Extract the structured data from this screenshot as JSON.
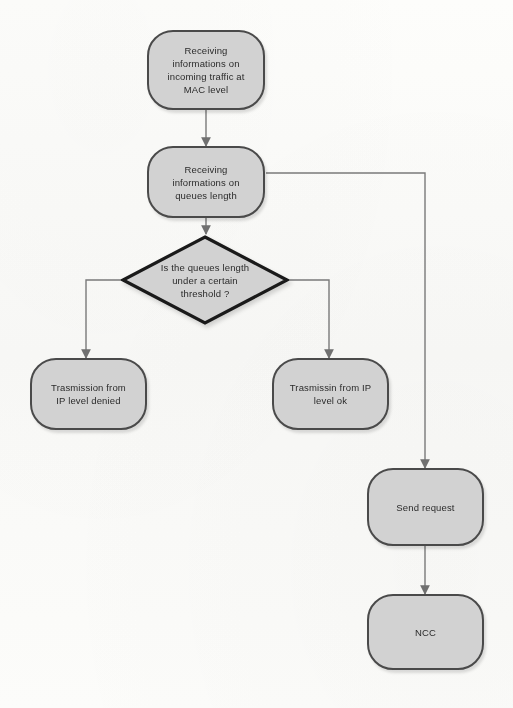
{
  "diagram": {
    "type": "flowchart",
    "title": "",
    "colors": {
      "node_fill": "#d2d2d2",
      "node_border": "#4a4a4a",
      "decision_border": "#1a1a1a",
      "connector": "#7a7a7a",
      "background": "#fbfbf9",
      "text": "#2b2b2b"
    },
    "nodes": [
      {
        "id": "receive_mac",
        "shape": "rounded-rectangle",
        "label": "Receiving\ninformations on\nincoming traffic at\nMAC level"
      },
      {
        "id": "receive_queues",
        "shape": "rounded-rectangle",
        "label": "Receiving\ninformations on\nqueues length"
      },
      {
        "id": "decision_threshold",
        "shape": "diamond",
        "label": "Is the queues length\nunder a certain\nthreshold ?"
      },
      {
        "id": "denied",
        "shape": "rounded-rectangle",
        "label": "Trasmission from\nIP level denied"
      },
      {
        "id": "ok",
        "shape": "rounded-rectangle",
        "label": "Trasmissin from IP\nlevel ok"
      },
      {
        "id": "send_request",
        "shape": "rounded-rectangle",
        "label": "Send request"
      },
      {
        "id": "ncc",
        "shape": "rounded-rectangle",
        "label": "NCC"
      }
    ],
    "edges": [
      {
        "from": "receive_mac",
        "to": "receive_queues",
        "label": ""
      },
      {
        "from": "receive_queues",
        "to": "decision_threshold",
        "label": ""
      },
      {
        "from": "receive_queues",
        "to": "send_request",
        "label": ""
      },
      {
        "from": "decision_threshold",
        "to": "denied",
        "label": ""
      },
      {
        "from": "decision_threshold",
        "to": "ok",
        "label": ""
      },
      {
        "from": "send_request",
        "to": "ncc",
        "label": ""
      }
    ]
  }
}
